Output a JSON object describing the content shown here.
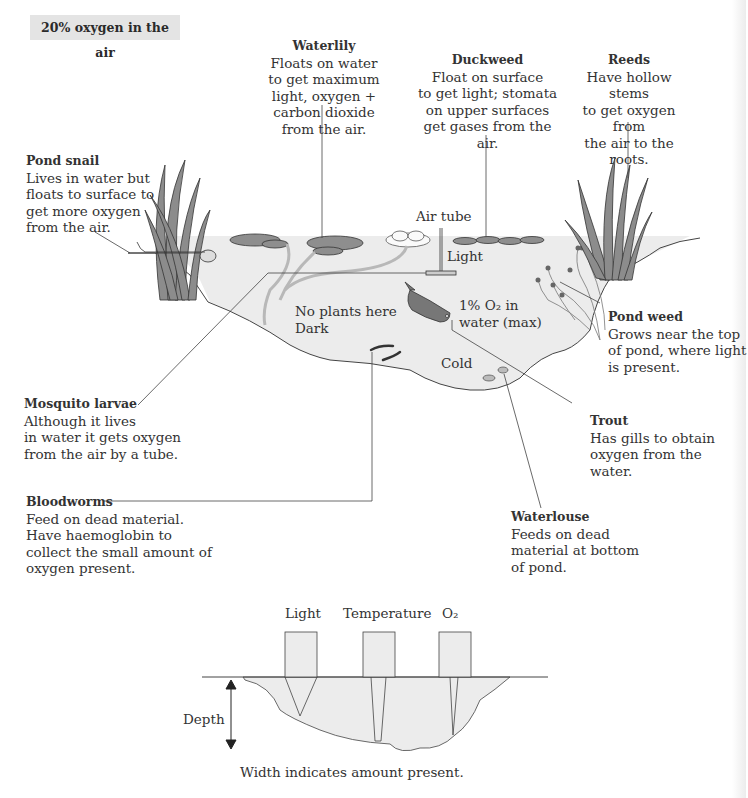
{
  "header": {
    "air_label": "20% oxygen in the air"
  },
  "labels": {
    "waterlily": {
      "title": "Waterlily",
      "desc": "Floats on water\nto get maximum\nlight, oxygen +\ncarbon dioxide\nfrom the air."
    },
    "duckweed": {
      "title": "Duckweed",
      "desc": "Float on surface\nto get light; stomata\non upper surfaces\nget gases from the air."
    },
    "reeds": {
      "title": "Reeds",
      "desc": "Have hollow stems\nto get oxygen from\nthe air to the roots."
    },
    "pond_snail": {
      "title": "Pond snail",
      "desc": "Lives in water but\nfloats to surface to\nget more oxygen\nfrom the air."
    },
    "pond_weed": {
      "title": "Pond weed",
      "desc": "Grows near the top\nof pond, where light\nis present."
    },
    "mosquito_larvae": {
      "title": "Mosquito larvae",
      "desc": "Although it lives\nin water it gets oxygen\nfrom the air by a tube."
    },
    "trout": {
      "title": "Trout",
      "desc": "Has gills to obtain\noxygen from the water."
    },
    "bloodworms": {
      "title": "Bloodworms",
      "desc": "Feed on dead material.\nHave haemoglobin to\ncollect the small amount of\noxygen present."
    },
    "waterlouse": {
      "title": "Waterlouse",
      "desc": "Feeds on dead\nmaterial at bottom\nof pond."
    }
  },
  "pond_annotations": {
    "air_tube": "Air tube",
    "light": "Light",
    "no_plants": "No plants here\nDark",
    "oxygen_water": "1% O₂ in\nwater (max)",
    "cold": "Cold"
  },
  "profile": {
    "columns": [
      "Light",
      "Temperature",
      "O₂"
    ],
    "depth_label": "Depth",
    "caption": "Width indicates amount present."
  },
  "colors": {
    "water": "#ececec",
    "plant": "#8a8a8a",
    "plant_dark": "#4a4a4a",
    "line": "#333333",
    "label_box": "#e4e4e4"
  }
}
